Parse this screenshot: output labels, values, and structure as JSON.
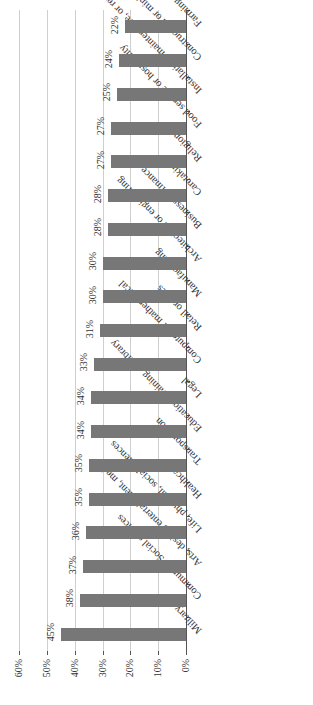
{
  "chart_data": {
    "type": "bar",
    "orientation": "horizontal (image rotated 180°)",
    "title": "",
    "xlabel": "",
    "ylabel": "",
    "xlim": [
      0,
      60
    ],
    "x_ticks": [
      "0%",
      "10%",
      "20%",
      "30%",
      "40%",
      "50%",
      "60%"
    ],
    "grid": true,
    "legend": null,
    "categories": [
      "Military",
      "Community/Social services",
      "Arts, design, entertainment, media",
      "Life, physical, social sciences",
      "Healthcare",
      "Transportation",
      "Education, training, or library",
      "Legal",
      "Computer or mathematical",
      "Retail or sales",
      "Manufacturing",
      "Architecture or engineering",
      "Business or finance",
      "Caretaking",
      "Religion",
      "Food service or hospitality",
      "Installation, maintenance, or repair",
      "Construction or mining",
      "Farming, fishing, or forestry"
    ],
    "values": [
      45,
      38,
      37,
      36,
      35,
      35,
      34,
      34,
      33,
      31,
      30,
      30,
      28,
      28,
      27,
      27,
      25,
      24,
      22
    ],
    "value_labels": [
      "45%",
      "38%",
      "37%",
      "36%",
      "35%",
      "35%",
      "34%",
      "34%",
      "33%",
      "31%",
      "30%",
      "30%",
      "28%",
      "28%",
      "27%",
      "27%",
      "25%",
      "24%",
      "22%"
    ],
    "bar_color": "#777777",
    "grid_color": "#cfcfcf"
  }
}
